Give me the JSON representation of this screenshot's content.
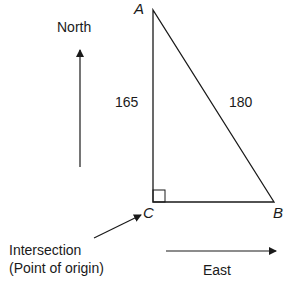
{
  "diagram": {
    "type": "right-triangle-navigation",
    "vertices": {
      "A": {
        "label": "A"
      },
      "B": {
        "label": "B"
      },
      "C": {
        "label": "C"
      }
    },
    "sides": {
      "AC": {
        "label": "165"
      },
      "AB": {
        "label": "180"
      }
    },
    "directions": {
      "north": "North",
      "east": "East"
    },
    "annotation": {
      "line1": "Intersection",
      "line2": "(Point of origin)"
    },
    "colors": {
      "stroke": "#1a1a1a",
      "background": "#ffffff"
    }
  }
}
